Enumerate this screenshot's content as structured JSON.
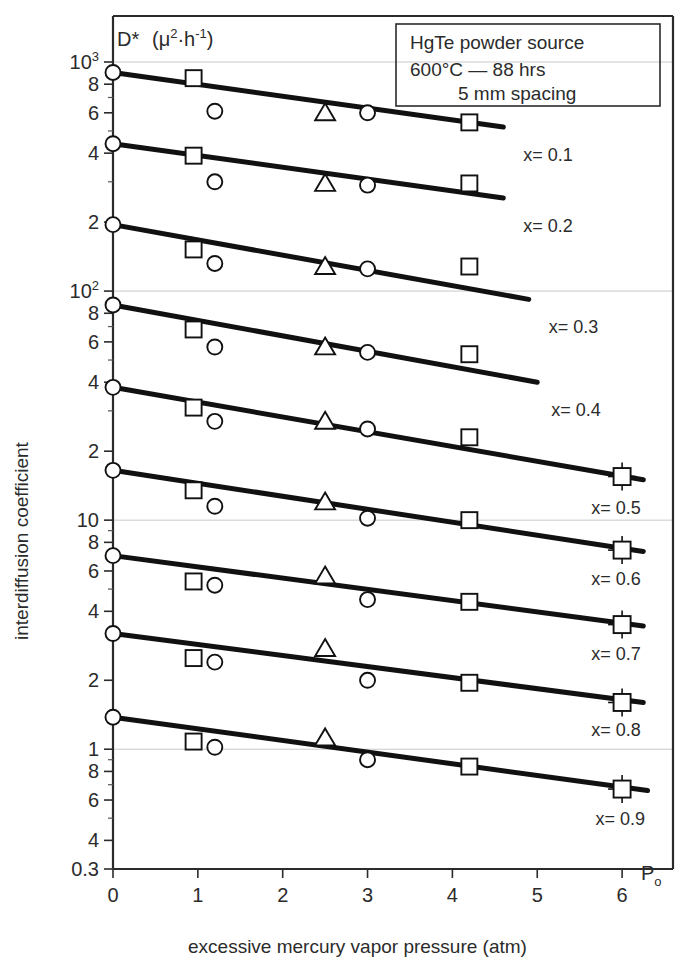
{
  "figure": {
    "y_axis_title": "interdiffusion coefficient",
    "x_axis_title": "excessive mercury vapor pressure (atm)",
    "quantity_label": "D*",
    "quantity_units_base": "(μ",
    "quantity_units_mid": "·h",
    "quantity_units_close": ")",
    "quantity_exp1": "2",
    "quantity_exp2": "-1",
    "po_label": "P",
    "po_sub": "o"
  },
  "legend": {
    "line1": "HgTe powder source",
    "line2": "600°C — 88 hrs",
    "line3": "5 mm spacing"
  },
  "chart_data": {
    "type": "line",
    "xlabel": "excessive mercury vapor pressure (atm)",
    "ylabel": "interdiffusion coefficient",
    "quantity": "D* (μ²·h⁻¹)",
    "xscale": "linear",
    "yscale": "log",
    "xlim": [
      0,
      6.6
    ],
    "ylim": [
      0.3,
      1000
    ],
    "grid": "major-horizontal-at-decades",
    "legend_position": "top-right",
    "x_ticks": [
      0,
      1,
      2,
      3,
      4,
      5,
      6
    ],
    "x_tick_labels": [
      "0",
      "1",
      "2",
      "3",
      "4",
      "5",
      "6"
    ],
    "y_ticks": [
      1000,
      800,
      600,
      400,
      200,
      100,
      80,
      60,
      40,
      20,
      10,
      8,
      6,
      4,
      2,
      1,
      0.8,
      0.6,
      0.4,
      0.3
    ],
    "y_tick_labels": [
      "10³",
      "8",
      "6",
      "4",
      "2",
      "10²",
      "8",
      "6",
      "4",
      "2",
      "10",
      "8",
      "6",
      "4",
      "2",
      "1",
      "8",
      "6",
      "4",
      "0.3"
    ],
    "marker_legend": [
      {
        "symbol": "square",
        "name": "square-marker"
      },
      {
        "symbol": "circle",
        "name": "circle-marker"
      },
      {
        "symbol": "triangle",
        "name": "triangle-marker"
      },
      {
        "symbol": "square-errorbar",
        "name": "square-with-error-bars"
      }
    ],
    "series": [
      {
        "name": "x = 0.1",
        "label": "x= 0.1",
        "fit_line": {
          "x": [
            0,
            4.6
          ],
          "y": [
            900,
            520
          ]
        },
        "points": [
          {
            "x": 0.0,
            "y": 900,
            "marker": "circle"
          },
          {
            "x": 0.95,
            "y": 850,
            "marker": "square"
          },
          {
            "x": 1.2,
            "y": 610,
            "marker": "circle"
          },
          {
            "x": 2.5,
            "y": 600,
            "marker": "triangle"
          },
          {
            "x": 3.0,
            "y": 600,
            "marker": "circle"
          },
          {
            "x": 4.2,
            "y": 545,
            "marker": "square"
          }
        ]
      },
      {
        "name": "x = 0.2",
        "label": "x= 0.2",
        "fit_line": {
          "x": [
            0,
            4.6
          ],
          "y": [
            440,
            255
          ]
        },
        "points": [
          {
            "x": 0.0,
            "y": 440,
            "marker": "circle"
          },
          {
            "x": 0.95,
            "y": 390,
            "marker": "square"
          },
          {
            "x": 1.2,
            "y": 300,
            "marker": "circle"
          },
          {
            "x": 2.5,
            "y": 295,
            "marker": "triangle"
          },
          {
            "x": 3.0,
            "y": 290,
            "marker": "circle"
          },
          {
            "x": 4.2,
            "y": 295,
            "marker": "square"
          }
        ]
      },
      {
        "name": "x = 0.3",
        "label": "x= 0.3",
        "fit_line": {
          "x": [
            0,
            4.9
          ],
          "y": [
            195,
            92
          ]
        },
        "points": [
          {
            "x": 0.0,
            "y": 195,
            "marker": "circle"
          },
          {
            "x": 0.95,
            "y": 152,
            "marker": "square"
          },
          {
            "x": 1.2,
            "y": 132,
            "marker": "circle"
          },
          {
            "x": 2.5,
            "y": 128,
            "marker": "triangle"
          },
          {
            "x": 3.0,
            "y": 125,
            "marker": "circle"
          },
          {
            "x": 4.2,
            "y": 128,
            "marker": "square"
          }
        ]
      },
      {
        "name": "x = 0.4",
        "label": "x= 0.4",
        "fit_line": {
          "x": [
            0,
            5.0
          ],
          "y": [
            87,
            40
          ]
        },
        "points": [
          {
            "x": 0.0,
            "y": 87,
            "marker": "circle"
          },
          {
            "x": 0.95,
            "y": 68,
            "marker": "square"
          },
          {
            "x": 1.2,
            "y": 57,
            "marker": "circle"
          },
          {
            "x": 2.5,
            "y": 57,
            "marker": "triangle"
          },
          {
            "x": 3.0,
            "y": 54,
            "marker": "circle"
          },
          {
            "x": 4.2,
            "y": 53,
            "marker": "square"
          }
        ]
      },
      {
        "name": "x = 0.5",
        "label": "x= 0.5",
        "fit_line": {
          "x": [
            0,
            6.25
          ],
          "y": [
            38,
            15
          ]
        },
        "points": [
          {
            "x": 0.0,
            "y": 38,
            "marker": "circle"
          },
          {
            "x": 0.95,
            "y": 31,
            "marker": "square"
          },
          {
            "x": 1.2,
            "y": 27,
            "marker": "circle"
          },
          {
            "x": 2.5,
            "y": 27,
            "marker": "triangle"
          },
          {
            "x": 3.0,
            "y": 25,
            "marker": "circle"
          },
          {
            "x": 4.2,
            "y": 23,
            "marker": "square"
          },
          {
            "x": 6.0,
            "y": 15.5,
            "marker": "square-errorbar"
          }
        ]
      },
      {
        "name": "x = 0.6",
        "label": "x= 0.6",
        "fit_line": {
          "x": [
            0,
            6.25
          ],
          "y": [
            16.5,
            7.3
          ]
        },
        "points": [
          {
            "x": 0.0,
            "y": 16.5,
            "marker": "circle"
          },
          {
            "x": 0.95,
            "y": 13.5,
            "marker": "square"
          },
          {
            "x": 1.2,
            "y": 11.5,
            "marker": "circle"
          },
          {
            "x": 2.5,
            "y": 12.0,
            "marker": "triangle"
          },
          {
            "x": 3.0,
            "y": 10.2,
            "marker": "circle"
          },
          {
            "x": 4.2,
            "y": 10.0,
            "marker": "square"
          },
          {
            "x": 6.0,
            "y": 7.4,
            "marker": "square-errorbar"
          }
        ]
      },
      {
        "name": "x = 0.7",
        "label": "x= 0.7",
        "fit_line": {
          "x": [
            0,
            6.25
          ],
          "y": [
            7.0,
            3.45
          ]
        },
        "points": [
          {
            "x": 0.0,
            "y": 7.0,
            "marker": "circle"
          },
          {
            "x": 0.95,
            "y": 5.4,
            "marker": "square"
          },
          {
            "x": 1.2,
            "y": 5.2,
            "marker": "circle"
          },
          {
            "x": 2.5,
            "y": 5.7,
            "marker": "triangle"
          },
          {
            "x": 3.0,
            "y": 4.5,
            "marker": "circle"
          },
          {
            "x": 4.2,
            "y": 4.4,
            "marker": "square"
          },
          {
            "x": 6.0,
            "y": 3.5,
            "marker": "square-errorbar"
          }
        ]
      },
      {
        "name": "x = 0.8",
        "label": "x= 0.8",
        "fit_line": {
          "x": [
            0,
            6.25
          ],
          "y": [
            3.2,
            1.6
          ]
        },
        "points": [
          {
            "x": 0.0,
            "y": 3.2,
            "marker": "circle"
          },
          {
            "x": 0.95,
            "y": 2.5,
            "marker": "square"
          },
          {
            "x": 1.2,
            "y": 2.4,
            "marker": "circle"
          },
          {
            "x": 2.5,
            "y": 2.75,
            "marker": "triangle"
          },
          {
            "x": 3.0,
            "y": 2.0,
            "marker": "circle"
          },
          {
            "x": 4.2,
            "y": 1.95,
            "marker": "square"
          },
          {
            "x": 6.0,
            "y": 1.6,
            "marker": "square-errorbar"
          }
        ]
      },
      {
        "name": "x = 0.9",
        "label": "x= 0.9",
        "fit_line": {
          "x": [
            0,
            6.3
          ],
          "y": [
            1.38,
            0.66
          ]
        },
        "points": [
          {
            "x": 0.0,
            "y": 1.38,
            "marker": "circle"
          },
          {
            "x": 0.95,
            "y": 1.08,
            "marker": "square"
          },
          {
            "x": 1.2,
            "y": 1.02,
            "marker": "circle"
          },
          {
            "x": 2.5,
            "y": 1.12,
            "marker": "triangle"
          },
          {
            "x": 3.0,
            "y": 0.9,
            "marker": "circle"
          },
          {
            "x": 4.2,
            "y": 0.84,
            "marker": "square"
          },
          {
            "x": 6.0,
            "y": 0.67,
            "marker": "square-errorbar"
          }
        ]
      }
    ]
  },
  "colors": {
    "ink": "#111111",
    "axis": "#2b2b2b",
    "grid": "#c9c9c9",
    "paper": "#ffffff"
  }
}
